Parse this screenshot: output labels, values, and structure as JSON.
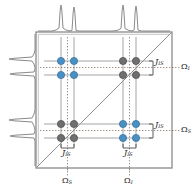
{
  "figure": {
    "name": "two-dimensional-correlation-spectrum",
    "type": "2d-nmr-cosy-schematic",
    "background": "#ffffff"
  },
  "colors": {
    "cross_peak_blue": "#4a90c2",
    "diagonal_peak_gray": "#6f6f6f",
    "frame": "#8a8a8a",
    "grid_line": "#9a9a9a",
    "dotted_line": "#7f7f7f",
    "diagonal_line": "#8f8f8f",
    "projection_trace": "#8a8a8a",
    "text": "#1a1a1a"
  },
  "plot_box": {
    "x": 36,
    "y": 32,
    "width": 136,
    "height": 136,
    "diagonal_from": "bottom-left",
    "diagonal_to": "top-right"
  },
  "axes": {
    "bottom": {
      "name": "f2-axis",
      "ticks": [
        {
          "label": "Ω",
          "sub": "S",
          "x": 67
        },
        {
          "label": "Ω",
          "sub": "I",
          "x": 129
        }
      ]
    },
    "right": {
      "name": "f1-axis",
      "ticks": [
        {
          "label": "Ω",
          "sub": "I",
          "x": 178,
          "y": 66
        },
        {
          "label": "Ω",
          "sub": "S",
          "x": 178,
          "y": 128
        }
      ]
    }
  },
  "projections": {
    "top": {
      "name": "top-projection-spectrum",
      "peak_positions": [
        61,
        74,
        123,
        136
      ],
      "doublets": 2,
      "peaks_per_doublet": 2
    },
    "left": {
      "name": "left-projection-spectrum",
      "peak_positions": [
        60,
        78,
        125,
        143
      ],
      "doublets": 2,
      "peaks_per_doublet": 2
    }
  },
  "peak_grid": {
    "columns_x": [
      61,
      74,
      123,
      136
    ],
    "rows_y": [
      61,
      75,
      124,
      138
    ]
  },
  "peaks": [
    {
      "group": "cross-peak-upper-left",
      "color": "blue",
      "cx": 61,
      "cy": 61
    },
    {
      "group": "cross-peak-upper-left",
      "color": "blue",
      "cx": 74,
      "cy": 61
    },
    {
      "group": "cross-peak-upper-left",
      "color": "blue",
      "cx": 61,
      "cy": 75
    },
    {
      "group": "cross-peak-upper-left",
      "color": "blue",
      "cx": 74,
      "cy": 75
    },
    {
      "group": "diagonal-peak-upper-right",
      "color": "gray",
      "cx": 123,
      "cy": 61
    },
    {
      "group": "diagonal-peak-upper-right",
      "color": "gray",
      "cx": 136,
      "cy": 61
    },
    {
      "group": "diagonal-peak-upper-right",
      "color": "gray",
      "cx": 123,
      "cy": 75
    },
    {
      "group": "diagonal-peak-upper-right",
      "color": "gray",
      "cx": 136,
      "cy": 75
    },
    {
      "group": "diagonal-peak-lower-left",
      "color": "gray",
      "cx": 61,
      "cy": 124
    },
    {
      "group": "diagonal-peak-lower-left",
      "color": "gray",
      "cx": 74,
      "cy": 124
    },
    {
      "group": "diagonal-peak-lower-left",
      "color": "gray",
      "cx": 61,
      "cy": 138
    },
    {
      "group": "diagonal-peak-lower-left",
      "color": "gray",
      "cx": 74,
      "cy": 138
    },
    {
      "group": "cross-peak-lower-right",
      "color": "blue",
      "cx": 123,
      "cy": 124
    },
    {
      "group": "cross-peak-lower-right",
      "color": "blue",
      "cx": 136,
      "cy": 124
    },
    {
      "group": "cross-peak-lower-right",
      "color": "blue",
      "cx": 123,
      "cy": 138
    },
    {
      "group": "cross-peak-lower-right",
      "color": "blue",
      "cx": 136,
      "cy": 138
    }
  ],
  "coupling_labels": [
    {
      "name": "j-label-right-upper",
      "label": "J",
      "sub": "IS",
      "x": 156,
      "y": 63
    },
    {
      "name": "j-label-right-lower",
      "label": "J",
      "sub": "IS",
      "x": 156,
      "y": 126
    },
    {
      "name": "j-label-bottom-left",
      "label": "J",
      "sub": "IS",
      "x": 62,
      "y": 150
    },
    {
      "name": "j-label-bottom-right",
      "label": "J",
      "sub": "IS",
      "x": 124,
      "y": 150
    }
  ],
  "symbols": {
    "omega": "Ω",
    "j": "J",
    "sub_I": "I",
    "sub_S": "S",
    "sub_IS": "IS"
  }
}
